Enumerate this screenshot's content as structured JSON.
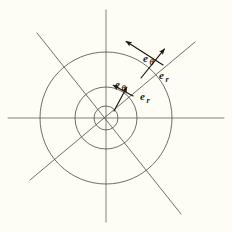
{
  "figure": {
    "background_color": "#fdfdf5",
    "stroke_color": "#55554e",
    "label_color": "#1a1a18",
    "width": 232,
    "height": 232
  },
  "chart_data": {
    "type": "scatter",
    "xlabel": "",
    "ylabel": "",
    "center": {
      "x": 106,
      "y": 118
    },
    "axes": {
      "horizontal": {
        "x1": 8,
        "y1": 118,
        "x2": 224,
        "y2": 118
      },
      "vertical": {
        "x1": 106,
        "y1": 10,
        "x2": 106,
        "y2": 222
      }
    },
    "circles": [
      {
        "name": "inner-circle",
        "radius": 12
      },
      {
        "name": "middle-circle",
        "radius": 31
      },
      {
        "name": "outer-circle",
        "radius": 66
      }
    ],
    "diagonals": [
      {
        "name": "diagonal-ne-sw",
        "angle_deg": 35,
        "x1": 195,
        "y1": 42,
        "x2": 30,
        "y2": 180
      },
      {
        "name": "diagonal-nw-se",
        "angle_deg": 145,
        "x1": 37,
        "y1": 33,
        "x2": 181,
        "y2": 214
      }
    ],
    "vectors": [
      {
        "name": "inner-e-r",
        "label": "e",
        "subscript": "r",
        "radius": 31,
        "angle_deg": 40,
        "direction": "radial-outward",
        "tail": {
          "x": 114,
          "y": 111
        },
        "head": {
          "x": 128,
          "y": 85
        }
      },
      {
        "name": "inner-e-theta",
        "label": "e",
        "subscript": "θ",
        "radius": 31,
        "angle_deg": 40,
        "direction": "tangential-ccw",
        "tail": {
          "x": 133,
          "y": 96
        },
        "head": {
          "x": 111,
          "y": 84
        }
      },
      {
        "name": "outer-e-r",
        "label": "e",
        "subscript": "r",
        "radius": 66,
        "angle_deg": 40,
        "direction": "radial-outward",
        "tail": {
          "x": 141,
          "y": 78
        },
        "head": {
          "x": 166,
          "y": 47
        }
      },
      {
        "name": "outer-e-theta",
        "label": "e",
        "subscript": "θ",
        "radius": 66,
        "angle_deg": 40,
        "direction": "tangential-ccw",
        "tail": {
          "x": 163,
          "y": 65
        },
        "head": {
          "x": 124,
          "y": 40
        }
      }
    ],
    "labels": [
      {
        "name": "outer-e-theta-label",
        "base": "e",
        "sub": "θ",
        "x": 143,
        "y": 62
      },
      {
        "name": "outer-e-r-label",
        "base": "e",
        "sub": "r",
        "x": 159,
        "y": 79
      },
      {
        "name": "inner-e-theta-label",
        "base": "e",
        "sub": "θ",
        "x": 115,
        "y": 88
      },
      {
        "name": "inner-e-r-label",
        "base": "e",
        "sub": "r",
        "x": 140,
        "y": 100
      }
    ],
    "grid": false,
    "legend": "none"
  }
}
